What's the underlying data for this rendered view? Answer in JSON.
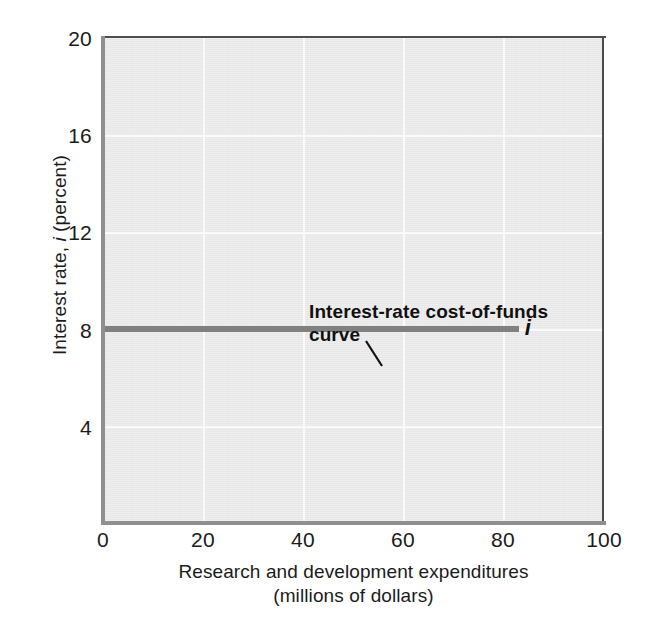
{
  "chart_data": {
    "type": "line",
    "title": "",
    "xlabel": "Research and development expenditures",
    "xlabel_line2": "(millions of dollars)",
    "ylabel_prefix": "Interest rate, ",
    "ylabel_symbol": "i",
    "ylabel_suffix": " (percent)",
    "xlim": [
      0,
      100
    ],
    "ylim": [
      0,
      20
    ],
    "xticks": [
      "0",
      "20",
      "40",
      "60",
      "80",
      "100"
    ],
    "xtick_values": [
      0,
      20,
      40,
      60,
      80,
      100
    ],
    "yticks": [
      "20",
      "16",
      "12",
      "8",
      "4"
    ],
    "ytick_values": [
      20,
      16,
      12,
      8,
      4
    ],
    "grid": true,
    "legend": "none",
    "series": [
      {
        "name": "Interest-rate cost-of-funds curve",
        "symbol": "i",
        "color": "#808080",
        "x": [
          0,
          83
        ],
        "values": [
          8,
          8
        ]
      }
    ],
    "annotations": [
      {
        "text_line1": "Interest-rate cost-of-funds",
        "text_line2": "curve",
        "points_to_x": 36,
        "points_to_y": 8
      }
    ]
  },
  "colors": {
    "panel_background": "#e9e9e9",
    "gridline": "#fafafa",
    "curve": "#808080",
    "axis_dark": "#4d4d4d",
    "axis_gray": "#8f8f8f",
    "text": "#1b1b1b",
    "page_background": "#ffffff"
  }
}
